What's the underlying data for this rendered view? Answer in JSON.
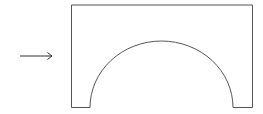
{
  "diagram": {
    "colors": {
      "stroke": "#555555",
      "background": "#ffffff",
      "arrow": "#333333"
    },
    "arrow": {
      "x1": 20,
      "y1": 56,
      "x2": 52,
      "y2": 56
    },
    "block": {
      "left": 71.5,
      "top": 5,
      "right": 252.5,
      "bottom": 107.5
    },
    "arch": {
      "left": 90,
      "right": 233,
      "cx": 161.5,
      "top": 41,
      "rx": 71.5,
      "ry": 66.5
    }
  }
}
